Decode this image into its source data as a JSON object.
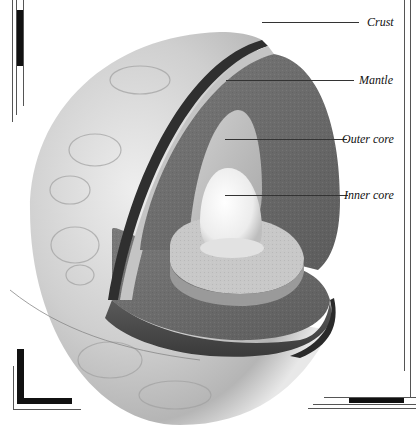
{
  "diagram": {
    "labels": [
      {
        "id": "crust",
        "text": "Crust"
      },
      {
        "id": "mantle",
        "text": "Mantle"
      },
      {
        "id": "outer_core",
        "text": "Outer core"
      },
      {
        "id": "inner_core",
        "text": "Inner core"
      }
    ]
  },
  "colors": {
    "background": "#ffffff",
    "frame": "#111111",
    "clouds": "#d8d8d8",
    "crust": "#333333",
    "mantle": "#6e6e6e",
    "outer_core": "#b9b9b9",
    "inner_core": "#f2f2f2",
    "leader": "#333333"
  }
}
